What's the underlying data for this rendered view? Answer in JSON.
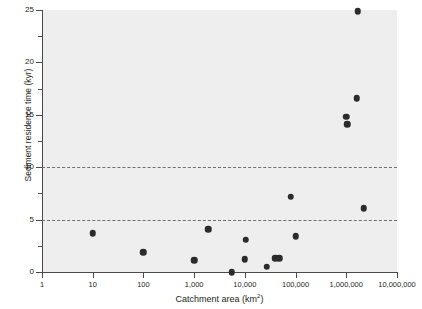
{
  "chart_data": {
    "type": "scatter",
    "title": "",
    "xlabel": "Catchment area (km²)",
    "ylabel": "Sediment residence time (kyr)",
    "xscale": "log",
    "yscale": "linear",
    "xlim": [
      1,
      10000000
    ],
    "ylim": [
      0,
      25
    ],
    "grid": false,
    "legend": null,
    "background_color": "#eeeeee",
    "point_color": "#2b2b2b",
    "xticks": [
      1,
      10,
      100,
      1000,
      10000,
      100000,
      1000000,
      10000000
    ],
    "xtick_labels": [
      "1",
      "10",
      "100",
      "1,000",
      "10,000",
      "100,000",
      "1,000,000",
      "10,000,000"
    ],
    "yticks": [
      0,
      5,
      10,
      15,
      20,
      25
    ],
    "ytick_labels": [
      "0",
      "5",
      "10",
      "15",
      "20",
      "25"
    ],
    "yticks_minor": [
      2.5,
      7.5,
      12.5,
      17.5,
      22.5
    ],
    "reference_lines": [
      {
        "y": 5,
        "style": "dashed",
        "color": "#6f6f6f"
      },
      {
        "y": 10,
        "style": "dashed",
        "color": "#6f6f6f"
      }
    ],
    "points": [
      {
        "x": 10,
        "y": 3.7
      },
      {
        "x": 100,
        "y": 1.9
      },
      {
        "x": 1000,
        "y": 1.1
      },
      {
        "x": 1900,
        "y": 4.1
      },
      {
        "x": 5500,
        "y": 0.0
      },
      {
        "x": 10000,
        "y": 1.2
      },
      {
        "x": 10500,
        "y": 3.1
      },
      {
        "x": 27000,
        "y": 0.5
      },
      {
        "x": 40000,
        "y": 1.3
      },
      {
        "x": 48000,
        "y": 1.3
      },
      {
        "x": 80000,
        "y": 7.2
      },
      {
        "x": 100000,
        "y": 3.4
      },
      {
        "x": 1000000,
        "y": 14.8
      },
      {
        "x": 1050000,
        "y": 14.1
      },
      {
        "x": 1600000,
        "y": 16.6
      },
      {
        "x": 1700000,
        "y": 24.9
      },
      {
        "x": 2200000,
        "y": 6.1
      }
    ]
  }
}
